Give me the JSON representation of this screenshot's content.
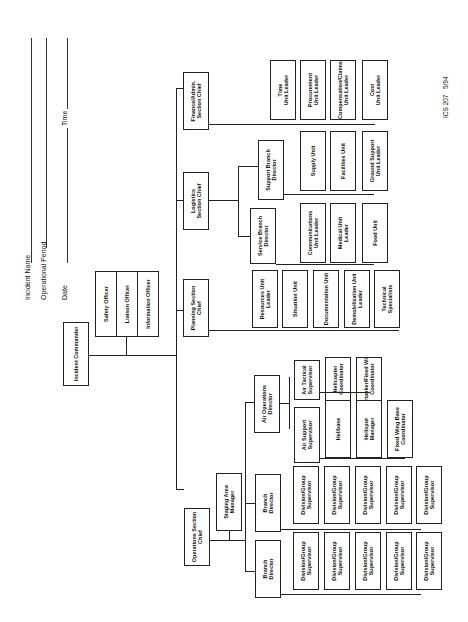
{
  "form": {
    "id": "ICS 207",
    "revision": "5/94",
    "fields": [
      {
        "label": "Incident Name",
        "value": ""
      },
      {
        "label": "Operational Period",
        "value": ""
      },
      {
        "label": "Date",
        "value": ""
      },
      {
        "label": "Time",
        "value": ""
      }
    ]
  },
  "command": {
    "incident_commander": "Incident Commander",
    "staff": [
      "Safety Officer",
      "Liaison Officer",
      "Information Officer"
    ]
  },
  "sections": {
    "operations": {
      "chief": "Operations Section\nChief",
      "staging": "Staging Area\nManager",
      "branches": [
        "Branch\nDirector",
        "Branch\nDirector"
      ],
      "divisions": "Division/Group\nSupervisor",
      "air_ops": "Air Operations\nDirector",
      "air_tactical": "Air Tactical\nSupervisor",
      "air_support": "Air Support\nSupervisor",
      "air_tactical_units": [
        "Helicopter\nCoordinator",
        "Airtanker/Fixed Wing\nCoordinator"
      ],
      "air_support_units": [
        "Helibase",
        "Helispot\nManager",
        "Fixed Wing Base\nCoordinator"
      ]
    },
    "planning": {
      "chief": "Planning Section\nChief",
      "units": [
        "Resources Unit\nLeader",
        "Situation Unit",
        "Documentation Unit",
        "Demobilization Unit\nLeader",
        "Technical\nSpecialists"
      ]
    },
    "logistics": {
      "chief": "Logistics\nSection Chief",
      "service_branch": "Service Branch\nDirector",
      "service_units": [
        "Communications\nUnit Leader",
        "Medical Unit\nLeader",
        "Food Unit"
      ],
      "support_branch": "Support Branch\nDirector",
      "support_units": [
        "Supply Unit",
        "Facilities Unit",
        "Ground Support\nUnit Leader"
      ]
    },
    "finance": {
      "chief": "Finance/Admin.\nSection Chief",
      "units": [
        "Time\nUnit Leader",
        "Procurement\nUnit Leader",
        "Compensation/Claims\nUnit Leader",
        "Cost\nUnit Leader"
      ]
    }
  }
}
